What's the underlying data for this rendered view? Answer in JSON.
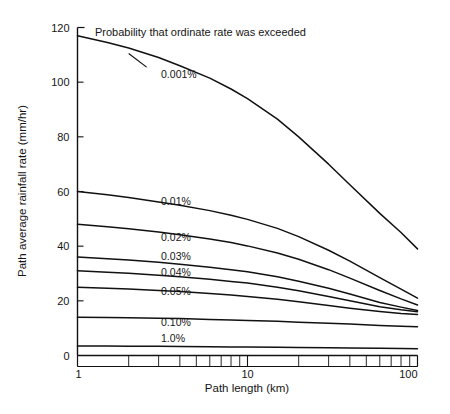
{
  "page": {
    "cut_off_header": "",
    "background_color": "#ffffff",
    "line_color": "#111111"
  },
  "chart_data": {
    "type": "line",
    "title": "",
    "xlabel": "Path length (km)",
    "ylabel": "Path average rainfall rate (mm/hr)",
    "annotation": "Probability that ordinate rate was exceeded",
    "xscale": "log",
    "yscale": "linear",
    "xlim": [
      1,
      100
    ],
    "ylim": [
      0,
      120
    ],
    "grid": false,
    "legend_position": "inline-labels",
    "xticks": [
      1,
      10,
      100
    ],
    "xtick_labels": [
      "1",
      "10",
      "100"
    ],
    "xminor_ticks": [
      2,
      3,
      4,
      5,
      6,
      7,
      8,
      9,
      20,
      30,
      40,
      50,
      60,
      70,
      80,
      90
    ],
    "yticks": [
      0,
      20,
      40,
      60,
      80,
      100,
      120
    ],
    "ytick_labels": [
      "0",
      "20",
      "40",
      "60",
      "80",
      "100",
      "120"
    ],
    "series": [
      {
        "name": "0.001%",
        "label": "0.001%",
        "label_x": 3.1,
        "label_y": 103,
        "x": [
          1,
          1.5,
          2,
          3,
          4,
          6,
          8,
          10,
          15,
          20,
          30,
          40,
          60,
          80,
          100
        ],
        "y": [
          117,
          114.5,
          112.5,
          109,
          106,
          101.5,
          97.5,
          94,
          86.5,
          80,
          70,
          62.5,
          52,
          45,
          39
        ]
      },
      {
        "name": "0.01%",
        "label": "0.01%",
        "label_x": 3.1,
        "label_y": 56.5,
        "x": [
          1,
          1.5,
          2,
          3,
          4,
          6,
          8,
          10,
          15,
          20,
          30,
          40,
          60,
          80,
          100
        ],
        "y": [
          60,
          58.8,
          57.8,
          56.2,
          55,
          53,
          51.3,
          49.8,
          46.5,
          43.5,
          38.5,
          34.5,
          28.5,
          24.3,
          21
        ]
      },
      {
        "name": "0.02%",
        "label": "0.02%",
        "label_x": 3.1,
        "label_y": 43.5,
        "x": [
          1,
          1.5,
          2,
          3,
          4,
          6,
          8,
          10,
          15,
          20,
          30,
          40,
          60,
          80,
          100
        ],
        "y": [
          48,
          47.1,
          46.4,
          45.2,
          44.2,
          42.6,
          41.3,
          40.1,
          37.5,
          35.2,
          31.4,
          28.3,
          23.8,
          20.7,
          18.5
        ]
      },
      {
        "name": "0.03%",
        "label": "0.03%",
        "label_x": 3.1,
        "label_y": 36.5,
        "x": [
          1,
          1.5,
          2,
          3,
          4,
          6,
          8,
          10,
          15,
          20,
          30,
          40,
          60,
          80,
          100
        ],
        "y": [
          36,
          35.4,
          34.9,
          34.1,
          33.4,
          32.3,
          31.4,
          30.6,
          28.8,
          27.2,
          24.6,
          22.5,
          19.4,
          17.7,
          16.5
        ]
      },
      {
        "name": "0.04%",
        "label": "0.04%",
        "label_x": 3.1,
        "label_y": 30.5,
        "x": [
          1,
          1.5,
          2,
          3,
          4,
          6,
          8,
          10,
          15,
          20,
          30,
          40,
          60,
          80,
          100
        ],
        "y": [
          31,
          30.5,
          30.1,
          29.4,
          28.8,
          27.9,
          27.1,
          26.5,
          25,
          23.7,
          21.6,
          20,
          17.8,
          16.7,
          16
        ]
      },
      {
        "name": "0.05%",
        "label": "0.05%",
        "label_x": 3.1,
        "label_y": 23.5,
        "x": [
          1,
          1.5,
          2,
          3,
          4,
          6,
          8,
          10,
          15,
          20,
          30,
          40,
          60,
          80,
          100
        ],
        "y": [
          25,
          24.6,
          24.3,
          23.8,
          23.4,
          22.7,
          22.1,
          21.6,
          20.6,
          19.7,
          18.3,
          17.3,
          16.1,
          15.4,
          15
        ]
      },
      {
        "name": "0.10%",
        "label": "0.10%",
        "label_x": 3.1,
        "label_y": 12.2,
        "x": [
          1,
          1.5,
          2,
          3,
          4,
          6,
          8,
          10,
          15,
          20,
          30,
          40,
          60,
          80,
          100
        ],
        "y": [
          14,
          13.9,
          13.8,
          13.6,
          13.5,
          13.2,
          13,
          12.8,
          12.5,
          12.2,
          11.8,
          11.5,
          11,
          10.7,
          10.5
        ]
      },
      {
        "name": "1.0%",
        "label": "1.0%",
        "label_x": 3.1,
        "label_y": 6.3,
        "x": [
          1,
          1.5,
          2,
          3,
          4,
          6,
          8,
          10,
          15,
          20,
          30,
          40,
          60,
          80,
          100
        ],
        "y": [
          3.5,
          3.45,
          3.4,
          3.35,
          3.3,
          3.2,
          3.15,
          3.1,
          3,
          2.95,
          2.85,
          2.78,
          2.68,
          2.6,
          2.5
        ]
      }
    ]
  }
}
